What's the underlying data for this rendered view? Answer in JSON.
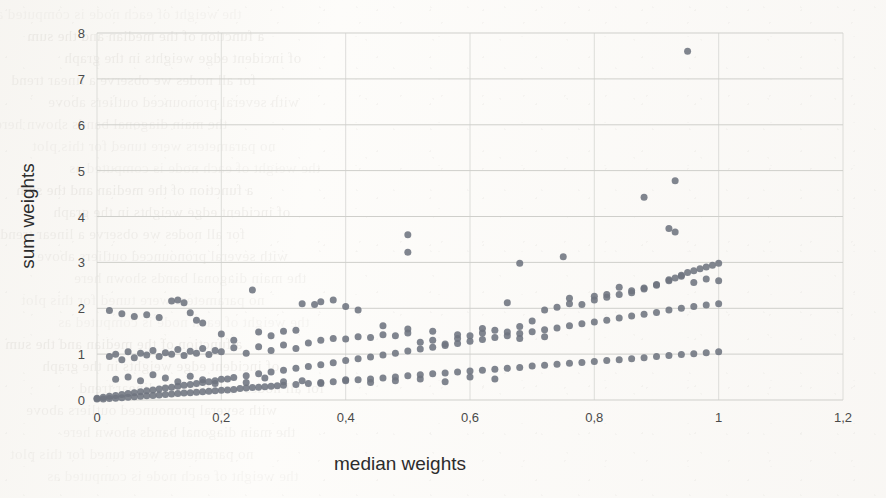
{
  "page": {
    "media": "scanned-book-page",
    "background_color": "#fdfcfa",
    "bleed_through_lines": [
      "the weight of each node is computed as",
      "a function of the median and the sum",
      "of incident edge weights in the graph",
      "for all nodes we observe a linear trend",
      "with several pronounced outliers above",
      "the main diagonal bands shown here",
      "no parameters were tuned for this plot"
    ]
  },
  "chart_data": {
    "type": "scatter",
    "title": "",
    "xlabel": "median weights",
    "ylabel": "sum weights",
    "xlim": [
      0,
      1.2
    ],
    "ylim": [
      0,
      8
    ],
    "xticks": [
      0,
      0.2,
      0.4,
      0.6,
      0.8,
      1.0,
      1.2
    ],
    "xtick_labels": [
      "0",
      "0,2",
      "0,4",
      "0,6",
      "0,8",
      "1",
      "1,2"
    ],
    "yticks": [
      0,
      1,
      2,
      3,
      4,
      5,
      6,
      7,
      8
    ],
    "ytick_labels": [
      "0",
      "1",
      "2",
      "3",
      "4",
      "5",
      "6",
      "7",
      "8"
    ],
    "decimal_separator": ",",
    "grid": {
      "horizontal": true,
      "vertical": true
    },
    "legend": {
      "visible": false,
      "position": "none"
    },
    "marker": {
      "shape": "circle",
      "size_px": 7,
      "color": "#6e7480",
      "opacity": 0.88
    },
    "series": [
      {
        "name": "band-lower",
        "description": "tight diagonal band from origin to (1.0, 1.05)",
        "points": [
          [
            0.0,
            0.02
          ],
          [
            0.01,
            0.02
          ],
          [
            0.02,
            0.03
          ],
          [
            0.03,
            0.04
          ],
          [
            0.04,
            0.05
          ],
          [
            0.05,
            0.06
          ],
          [
            0.06,
            0.07
          ],
          [
            0.07,
            0.08
          ],
          [
            0.08,
            0.09
          ],
          [
            0.09,
            0.1
          ],
          [
            0.1,
            0.11
          ],
          [
            0.11,
            0.12
          ],
          [
            0.12,
            0.13
          ],
          [
            0.13,
            0.14
          ],
          [
            0.14,
            0.15
          ],
          [
            0.15,
            0.16
          ],
          [
            0.16,
            0.17
          ],
          [
            0.17,
            0.18
          ],
          [
            0.18,
            0.19
          ],
          [
            0.19,
            0.2
          ],
          [
            0.2,
            0.21
          ],
          [
            0.21,
            0.22
          ],
          [
            0.22,
            0.23
          ],
          [
            0.23,
            0.25
          ],
          [
            0.24,
            0.26
          ],
          [
            0.25,
            0.27
          ],
          [
            0.26,
            0.28
          ],
          [
            0.27,
            0.29
          ],
          [
            0.28,
            0.3
          ],
          [
            0.29,
            0.31
          ],
          [
            0.3,
            0.32
          ],
          [
            0.32,
            0.34
          ],
          [
            0.34,
            0.36
          ],
          [
            0.36,
            0.38
          ],
          [
            0.38,
            0.4
          ],
          [
            0.4,
            0.42
          ],
          [
            0.42,
            0.44
          ],
          [
            0.44,
            0.46
          ],
          [
            0.46,
            0.48
          ],
          [
            0.48,
            0.5
          ],
          [
            0.5,
            0.53
          ],
          [
            0.52,
            0.55
          ],
          [
            0.54,
            0.57
          ],
          [
            0.56,
            0.59
          ],
          [
            0.58,
            0.61
          ],
          [
            0.6,
            0.63
          ],
          [
            0.62,
            0.65
          ],
          [
            0.64,
            0.67
          ],
          [
            0.66,
            0.69
          ],
          [
            0.68,
            0.71
          ],
          [
            0.7,
            0.74
          ],
          [
            0.72,
            0.76
          ],
          [
            0.74,
            0.78
          ],
          [
            0.76,
            0.8
          ],
          [
            0.78,
            0.82
          ],
          [
            0.8,
            0.84
          ],
          [
            0.82,
            0.86
          ],
          [
            0.84,
            0.88
          ],
          [
            0.86,
            0.9
          ],
          [
            0.88,
            0.92
          ],
          [
            0.9,
            0.95
          ],
          [
            0.92,
            0.97
          ],
          [
            0.94,
            0.99
          ],
          [
            0.96,
            1.01
          ],
          [
            0.98,
            1.03
          ],
          [
            1.0,
            1.05
          ]
        ]
      },
      {
        "name": "band-middle",
        "description": "diagonal band from origin to (1.0, 2.1)",
        "points": [
          [
            0.0,
            0.04
          ],
          [
            0.01,
            0.06
          ],
          [
            0.02,
            0.08
          ],
          [
            0.03,
            0.1
          ],
          [
            0.04,
            0.12
          ],
          [
            0.05,
            0.14
          ],
          [
            0.06,
            0.16
          ],
          [
            0.07,
            0.18
          ],
          [
            0.08,
            0.2
          ],
          [
            0.09,
            0.22
          ],
          [
            0.1,
            0.24
          ],
          [
            0.11,
            0.26
          ],
          [
            0.12,
            0.28
          ],
          [
            0.13,
            0.3
          ],
          [
            0.14,
            0.32
          ],
          [
            0.15,
            0.34
          ],
          [
            0.16,
            0.36
          ],
          [
            0.17,
            0.38
          ],
          [
            0.18,
            0.4
          ],
          [
            0.19,
            0.42
          ],
          [
            0.2,
            0.45
          ],
          [
            0.22,
            0.49
          ],
          [
            0.24,
            0.53
          ],
          [
            0.26,
            0.57
          ],
          [
            0.28,
            0.61
          ],
          [
            0.3,
            0.65
          ],
          [
            0.32,
            0.69
          ],
          [
            0.34,
            0.73
          ],
          [
            0.36,
            0.77
          ],
          [
            0.38,
            0.81
          ],
          [
            0.4,
            0.86
          ],
          [
            0.42,
            0.9
          ],
          [
            0.44,
            0.94
          ],
          [
            0.46,
            0.98
          ],
          [
            0.48,
            1.02
          ],
          [
            0.5,
            1.07
          ],
          [
            0.52,
            1.11
          ],
          [
            0.54,
            1.15
          ],
          [
            0.56,
            1.19
          ],
          [
            0.58,
            1.23
          ],
          [
            0.6,
            1.28
          ],
          [
            0.62,
            1.32
          ],
          [
            0.64,
            1.36
          ],
          [
            0.66,
            1.4
          ],
          [
            0.68,
            1.45
          ],
          [
            0.7,
            1.49
          ],
          [
            0.72,
            1.53
          ],
          [
            0.74,
            1.57
          ],
          [
            0.76,
            1.62
          ],
          [
            0.78,
            1.66
          ],
          [
            0.8,
            1.7
          ],
          [
            0.82,
            1.74
          ],
          [
            0.84,
            1.79
          ],
          [
            0.86,
            1.83
          ],
          [
            0.88,
            1.87
          ],
          [
            0.9,
            1.91
          ],
          [
            0.92,
            1.96
          ],
          [
            0.94,
            2.0
          ],
          [
            0.96,
            2.04
          ],
          [
            0.98,
            2.07
          ],
          [
            1.0,
            2.1
          ]
        ]
      },
      {
        "name": "band-upper",
        "description": "broad band from about (0.02, 0.95) to (1.0, 3.0)",
        "points": [
          [
            0.02,
            0.95
          ],
          [
            0.03,
            1.0
          ],
          [
            0.04,
            0.88
          ],
          [
            0.05,
            1.05
          ],
          [
            0.06,
            0.92
          ],
          [
            0.07,
            1.02
          ],
          [
            0.08,
            0.98
          ],
          [
            0.09,
            1.08
          ],
          [
            0.1,
            0.95
          ],
          [
            0.11,
            1.03
          ],
          [
            0.12,
            1.0
          ],
          [
            0.13,
            1.1
          ],
          [
            0.14,
            0.97
          ],
          [
            0.15,
            1.06
          ],
          [
            0.16,
            1.02
          ],
          [
            0.17,
            1.12
          ],
          [
            0.18,
            0.99
          ],
          [
            0.19,
            1.08
          ],
          [
            0.2,
            1.05
          ],
          [
            0.22,
            1.14
          ],
          [
            0.24,
            1.02
          ],
          [
            0.26,
            1.16
          ],
          [
            0.28,
            1.08
          ],
          [
            0.3,
            1.2
          ],
          [
            0.32,
            1.12
          ],
          [
            0.34,
            1.24
          ],
          [
            0.36,
            1.3
          ],
          [
            0.38,
            1.34
          ],
          [
            0.4,
            1.33
          ],
          [
            0.42,
            1.38
          ],
          [
            0.44,
            1.36
          ],
          [
            0.46,
            1.42
          ],
          [
            0.48,
            1.4
          ],
          [
            0.5,
            1.55
          ],
          [
            0.52,
            1.26
          ],
          [
            0.54,
            1.3
          ],
          [
            0.56,
            1.22
          ],
          [
            0.58,
            1.34
          ],
          [
            0.6,
            1.4
          ],
          [
            0.62,
            1.46
          ],
          [
            0.64,
            1.52
          ],
          [
            0.66,
            1.48
          ],
          [
            0.68,
            1.6
          ],
          [
            0.7,
            1.72
          ],
          [
            0.72,
            1.96
          ],
          [
            0.74,
            2.02
          ],
          [
            0.76,
            2.1
          ],
          [
            0.78,
            2.08
          ],
          [
            0.8,
            2.18
          ],
          [
            0.82,
            2.24
          ],
          [
            0.84,
            2.3
          ],
          [
            0.86,
            2.38
          ],
          [
            0.88,
            2.44
          ],
          [
            0.9,
            2.52
          ],
          [
            0.92,
            2.6
          ],
          [
            0.93,
            2.66
          ],
          [
            0.94,
            2.72
          ],
          [
            0.95,
            2.78
          ],
          [
            0.96,
            2.82
          ],
          [
            0.97,
            2.86
          ],
          [
            0.98,
            2.9
          ],
          [
            0.99,
            2.94
          ],
          [
            1.0,
            2.98
          ]
        ]
      },
      {
        "name": "scatter-low",
        "description": "sparse points between the lower and middle bands",
        "points": [
          [
            0.03,
            0.45
          ],
          [
            0.05,
            0.5
          ],
          [
            0.07,
            0.42
          ],
          [
            0.09,
            0.55
          ],
          [
            0.11,
            0.48
          ],
          [
            0.13,
            0.4
          ],
          [
            0.15,
            0.52
          ],
          [
            0.17,
            0.44
          ],
          [
            0.19,
            0.36
          ],
          [
            0.21,
            0.46
          ],
          [
            0.24,
            0.38
          ],
          [
            0.27,
            0.48
          ],
          [
            0.3,
            0.4
          ],
          [
            0.33,
            0.42
          ],
          [
            0.36,
            0.36
          ],
          [
            0.4,
            0.44
          ],
          [
            0.44,
            0.38
          ],
          [
            0.48,
            0.42
          ],
          [
            0.52,
            0.46
          ],
          [
            0.56,
            0.4
          ],
          [
            0.6,
            0.5
          ],
          [
            0.64,
            0.46
          ]
        ]
      },
      {
        "name": "scatter-mid",
        "description": "sparse points above the upper band around y = 1.3 to 2.4",
        "points": [
          [
            0.02,
            1.95
          ],
          [
            0.04,
            1.88
          ],
          [
            0.06,
            1.82
          ],
          [
            0.08,
            1.86
          ],
          [
            0.1,
            1.8
          ],
          [
            0.12,
            2.16
          ],
          [
            0.13,
            2.18
          ],
          [
            0.14,
            2.12
          ],
          [
            0.15,
            1.9
          ],
          [
            0.16,
            1.74
          ],
          [
            0.17,
            1.68
          ],
          [
            0.2,
            1.44
          ],
          [
            0.22,
            1.3
          ],
          [
            0.25,
            2.4
          ],
          [
            0.26,
            1.48
          ],
          [
            0.28,
            1.4
          ],
          [
            0.3,
            1.5
          ],
          [
            0.32,
            1.52
          ],
          [
            0.33,
            2.1
          ],
          [
            0.35,
            2.08
          ],
          [
            0.36,
            2.14
          ],
          [
            0.38,
            2.18
          ],
          [
            0.4,
            2.04
          ],
          [
            0.42,
            1.96
          ],
          [
            0.46,
            1.62
          ],
          [
            0.5,
            1.46
          ],
          [
            0.54,
            1.5
          ],
          [
            0.58,
            1.42
          ],
          [
            0.62,
            1.56
          ],
          [
            0.66,
            2.12
          ],
          [
            0.68,
            1.34
          ],
          [
            0.72,
            1.38
          ],
          [
            0.76,
            2.22
          ],
          [
            0.8,
            2.26
          ],
          [
            0.82,
            2.3
          ],
          [
            0.84,
            2.46
          ],
          [
            0.86,
            2.34
          ],
          [
            0.88,
            2.42
          ],
          [
            0.9,
            2.5
          ],
          [
            0.92,
            2.62
          ],
          [
            0.94,
            2.7
          ],
          [
            0.96,
            2.56
          ],
          [
            0.98,
            2.64
          ],
          [
            1.0,
            2.6
          ]
        ]
      },
      {
        "name": "outliers",
        "description": "isolated high points well above the bands",
        "points": [
          [
            0.5,
            3.6
          ],
          [
            0.5,
            3.22
          ],
          [
            0.68,
            2.98
          ],
          [
            0.75,
            3.12
          ],
          [
            0.88,
            4.42
          ],
          [
            0.93,
            4.78
          ],
          [
            0.92,
            3.74
          ],
          [
            0.93,
            3.66
          ],
          [
            0.95,
            7.6
          ]
        ]
      }
    ]
  }
}
